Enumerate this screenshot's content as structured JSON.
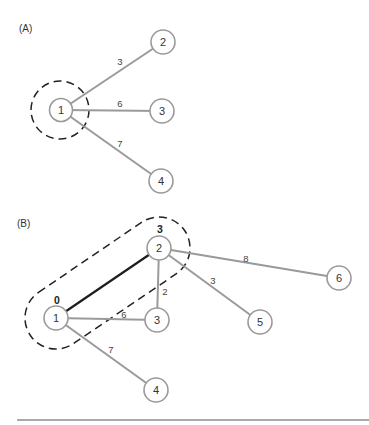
{
  "panels": [
    {
      "label": "(A)",
      "nodes": [
        {
          "id": "1",
          "x": 61,
          "y": 110
        },
        {
          "id": "2",
          "x": 163,
          "y": 42
        },
        {
          "id": "3",
          "x": 162,
          "y": 111
        },
        {
          "id": "4",
          "x": 161,
          "y": 181
        }
      ],
      "edges": [
        {
          "from": "1",
          "to": "2",
          "weight": "3",
          "lx": 120,
          "ly": 64
        },
        {
          "from": "1",
          "to": "3",
          "weight": "6",
          "lx": 120,
          "ly": 106
        },
        {
          "from": "1",
          "to": "4",
          "weight": "7",
          "lx": 120,
          "ly": 146
        }
      ],
      "highlight": {
        "shape": "circle",
        "around": [
          "1"
        ]
      }
    },
    {
      "label": "(B)",
      "nodes": [
        {
          "id": "1",
          "x": 56,
          "y": 318,
          "distance": "0"
        },
        {
          "id": "2",
          "x": 159,
          "y": 248,
          "distance": "3"
        },
        {
          "id": "3",
          "x": 157,
          "y": 320
        },
        {
          "id": "4",
          "x": 156,
          "y": 390
        },
        {
          "id": "5",
          "x": 260,
          "y": 322
        },
        {
          "id": "6",
          "x": 339,
          "y": 278
        }
      ],
      "edges": [
        {
          "from": "1",
          "to": "2",
          "weight": "",
          "bold": true
        },
        {
          "from": "1",
          "to": "3",
          "weight": "6",
          "lx": 124,
          "ly": 317
        },
        {
          "from": "1",
          "to": "4",
          "weight": "7",
          "lx": 111,
          "ly": 352
        },
        {
          "from": "2",
          "to": "3",
          "weight": "2",
          "lx": 165,
          "ly": 294
        },
        {
          "from": "2",
          "to": "5",
          "weight": "3",
          "lx": 213,
          "ly": 283
        },
        {
          "from": "2",
          "to": "6",
          "weight": "8",
          "lx": 246,
          "ly": 261
        }
      ],
      "highlight": {
        "shape": "capsule",
        "around": [
          "1",
          "2"
        ]
      }
    }
  ],
  "colors": {
    "edge": "#9a9a9a",
    "selected_edge": "#1e1e1e",
    "node_outline": "#9a9a9a",
    "dashed": "#222222"
  }
}
